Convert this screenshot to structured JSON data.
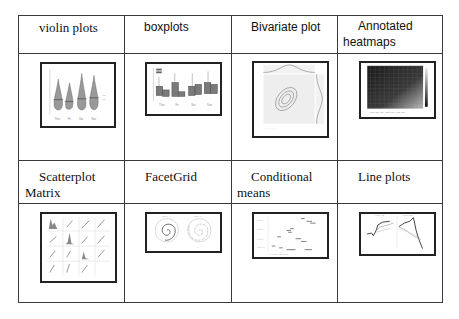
{
  "table": {
    "rows": [
      {
        "cells": [
          {
            "title_line1": "violin plots",
            "title_line2": "",
            "thumbnail": "violin-plot-thumbnail"
          },
          {
            "title_line1": "boxplots",
            "title_line2": "",
            "thumbnail": "boxplot-thumbnail"
          },
          {
            "title_line1": "Bivariate plot",
            "title_line2": "",
            "thumbnail": "bivariate-plot-thumbnail"
          },
          {
            "title_line1": "Annotated",
            "title_line2": "heatmaps",
            "thumbnail": "heatmap-thumbnail"
          }
        ]
      },
      {
        "cells": [
          {
            "title_line1": "Scatterplot",
            "title_line2": "Matrix",
            "thumbnail": "scatterplot-matrix-thumbnail"
          },
          {
            "title_line1": "FacetGrid",
            "title_line2": "",
            "thumbnail": "facetgrid-thumbnail"
          },
          {
            "title_line1": "Conditional",
            "title_line2": "means",
            "thumbnail": "conditional-means-thumbnail"
          },
          {
            "title_line1": "Line plots",
            "title_line2": "",
            "thumbnail": "line-plot-thumbnail"
          }
        ]
      }
    ]
  },
  "colors": {
    "border": "#3a3a3a",
    "thumb_border": "#222222",
    "text": "#111111"
  }
}
